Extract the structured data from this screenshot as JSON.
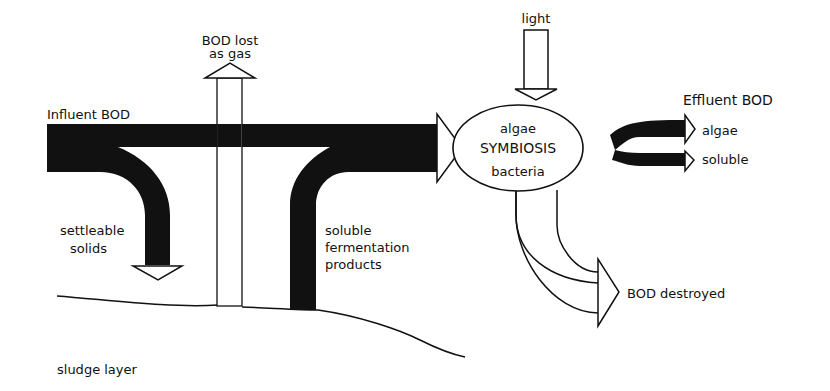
{
  "diagram": {
    "type": "flow-diagram",
    "labels": {
      "influent": "Influent BOD",
      "gas_line1": "BOD lost",
      "gas_line2": "as gas",
      "light": "light",
      "effluent": "Effluent BOD",
      "effluent_algae": "algae",
      "effluent_soluble": "soluble",
      "symbiosis_top": "algae",
      "symbiosis_mid": "SYMBIOSIS",
      "symbiosis_bottom": "bacteria",
      "settleable_line1": "settleable",
      "settleable_line2": "solids",
      "fermentation_line1": "soluble",
      "fermentation_line2": "fermentation",
      "fermentation_line3": "products",
      "destroyed": "BOD destroyed",
      "sludge": "sludge layer"
    },
    "colors": {
      "ink": "#111111",
      "background": "#ffffff"
    }
  }
}
